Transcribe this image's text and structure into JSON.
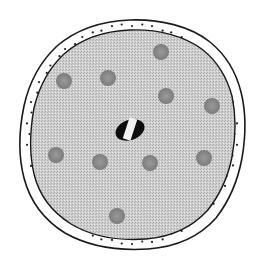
{
  "diagram": {
    "type": "cell-cross-section",
    "colors": {
      "background": "#ffffff",
      "outline": "#1a1a1a",
      "membrane_fill": "#ffffff",
      "membrane_dots": "#222222",
      "cytoplasm": "#c8c8c8",
      "granule": "#8a8a8a",
      "nucleus_dark": "#0d0d0d",
      "nucleus_light": "#f2f2f2"
    },
    "granules": [
      {
        "cx": 64,
        "cy": 81,
        "r": 8
      },
      {
        "cx": 108,
        "cy": 78,
        "r": 8
      },
      {
        "cx": 161,
        "cy": 52,
        "r": 8
      },
      {
        "cx": 166,
        "cy": 96,
        "r": 8
      },
      {
        "cx": 212,
        "cy": 106,
        "r": 8
      },
      {
        "cx": 56,
        "cy": 155,
        "r": 8
      },
      {
        "cx": 100,
        "cy": 162,
        "r": 8
      },
      {
        "cx": 150,
        "cy": 163,
        "r": 8
      },
      {
        "cx": 204,
        "cy": 158,
        "r": 8
      },
      {
        "cx": 117,
        "cy": 216,
        "r": 8
      }
    ],
    "nucleus": {
      "cx": 130,
      "cy": 130,
      "rx": 15,
      "ry": 10
    }
  }
}
